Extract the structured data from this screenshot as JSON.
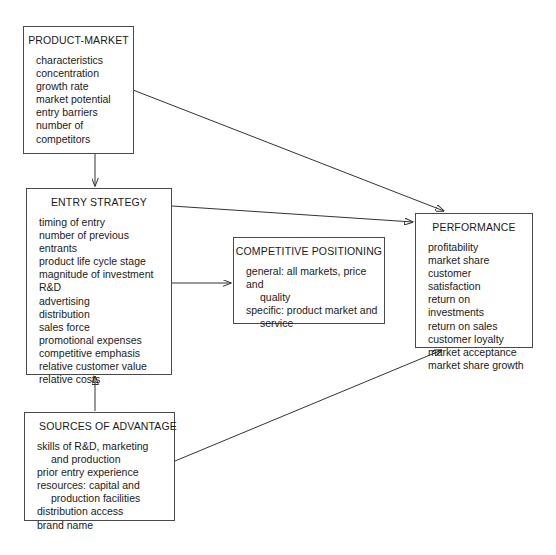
{
  "diagram": {
    "boxes": {
      "product_market": {
        "title": "PRODUCT-MARKET",
        "items": [
          "characteristics",
          "concentration",
          "growth rate",
          "market potential",
          "entry barriers",
          "number of",
          "competitors"
        ]
      },
      "entry_strategy": {
        "title": "ENTRY STRATEGY",
        "items": [
          "timing of entry",
          "number of previous entrants",
          "product life cycle stage",
          "magnitude of investment",
          "R&D",
          "advertising",
          "distribution",
          "sales force",
          "promotional expenses",
          "competitive emphasis",
          "relative customer value",
          "relative costs"
        ]
      },
      "competitive_positioning": {
        "title": "COMPETITIVE POSITIONING",
        "items": [
          "general: all markets, price and",
          "quality",
          "specific: product market and",
          "service"
        ]
      },
      "performance": {
        "title": "PERFORMANCE",
        "items": [
          "profitability",
          "market share",
          "customer satisfaction",
          "return on investments",
          "return on sales",
          "customer loyalty",
          "market acceptance",
          "market share growth"
        ]
      },
      "sources_of_advantage": {
        "title": "SOURCES OF ADVANTAGE",
        "items": [
          "skills of R&D, marketing",
          "and production",
          "prior entry experience",
          "resources: capital and",
          "production facilities",
          "distribution access",
          "brand name"
        ]
      }
    },
    "connectors": [
      {
        "name": "product-market-to-entry-strategy",
        "from": "product_market",
        "to": "entry_strategy"
      },
      {
        "name": "product-market-to-performance",
        "from": "product_market",
        "to": "performance"
      },
      {
        "name": "entry-strategy-to-performance",
        "from": "entry_strategy",
        "to": "performance"
      },
      {
        "name": "entry-strategy-to-competitive-positioning",
        "from": "entry_strategy",
        "to": "competitive_positioning"
      },
      {
        "name": "sources-of-advantage-to-entry-strategy",
        "from": "sources_of_advantage",
        "to": "entry_strategy"
      },
      {
        "name": "sources-of-advantage-to-performance",
        "from": "sources_of_advantage",
        "to": "performance"
      }
    ],
    "colors": {
      "box_border": "#4a4a4a",
      "connector": "#333333",
      "text": "#1a1a1a",
      "background": "#ffffff"
    }
  }
}
